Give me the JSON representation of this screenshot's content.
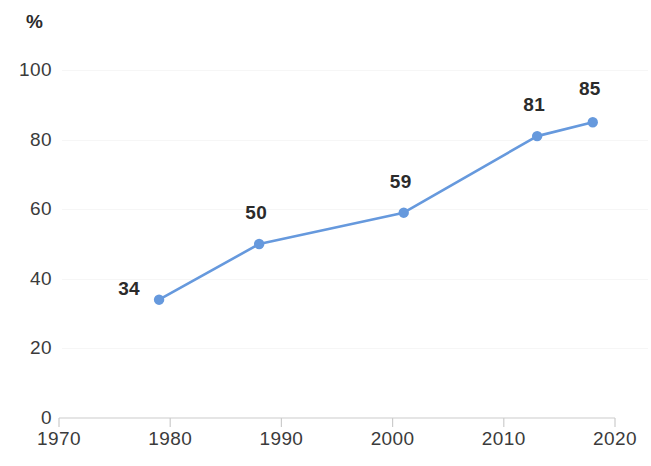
{
  "chart_data": {
    "type": "line",
    "title": "",
    "subtitle": "",
    "xlabel": "",
    "ylabel": "%",
    "unit_label": "%",
    "x": [
      1979,
      1988,
      2001,
      2013,
      2018
    ],
    "values": [
      34,
      50,
      59,
      81,
      85
    ],
    "point_labels": [
      "34",
      "50",
      "59",
      "81",
      "85"
    ],
    "series": [
      {
        "name": "",
        "values": [
          34,
          50,
          59,
          81,
          85
        ],
        "color": "#6699DD"
      }
    ],
    "xlim": [
      1970,
      2020
    ],
    "ylim": [
      0,
      100
    ],
    "xticks": [
      1970,
      1980,
      1990,
      2000,
      2010,
      2020
    ],
    "xtick_labels": [
      "1970",
      "1980",
      "1990",
      "2000",
      "2010",
      "2020"
    ],
    "yticks": [
      0,
      20,
      40,
      60,
      80,
      100
    ],
    "ytick_labels": [
      "0",
      "20",
      "40",
      "60",
      "80",
      "100"
    ],
    "grid": true,
    "grid_color": "#f6f6f6",
    "legend": false,
    "legend_position": "none",
    "line_color": "#6699DD",
    "marker_color": "#6699DD",
    "axis_color": "#cccccc",
    "label_color": "#2b2b2b",
    "tick_label_color": "#3b3b3b",
    "background": "#ffffff"
  }
}
